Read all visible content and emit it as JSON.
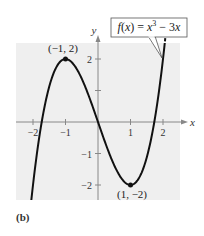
{
  "chart_data": {
    "type": "line",
    "title": "",
    "function": "f(x) = x^3 - 3x",
    "legend": [
      "f(x) = x³ − 3x"
    ],
    "xlabel": "x",
    "ylabel": "y",
    "xlim": [
      -2.5,
      2.5
    ],
    "ylim": [
      -2.5,
      2.5
    ],
    "x_ticks": [
      -2,
      -1,
      1,
      2
    ],
    "x_tick_labels": [
      "−2",
      "−1",
      "1",
      "2"
    ],
    "y_ticks": [
      -2,
      -1,
      1,
      2
    ],
    "y_tick_labels": [
      "−2",
      "−1",
      "",
      "2"
    ],
    "grid": false,
    "series": [
      {
        "name": "f(x) = x³ − 3x",
        "x": [
          -1.9,
          -1.5,
          -1,
          -0.5,
          0,
          0.5,
          1,
          1.5,
          2,
          2.1
        ],
        "y": [
          -1.159,
          1.125,
          2,
          1.375,
          0,
          -1.375,
          -2,
          -1.125,
          2,
          2.961
        ]
      }
    ],
    "annotations": [
      {
        "label": "(−1, 2)",
        "x": -1,
        "y": 2,
        "type": "relative maximum"
      },
      {
        "label": "(1, −2)",
        "x": 1,
        "y": -2,
        "type": "relative minimum"
      }
    ],
    "panel_label": "(b)"
  }
}
